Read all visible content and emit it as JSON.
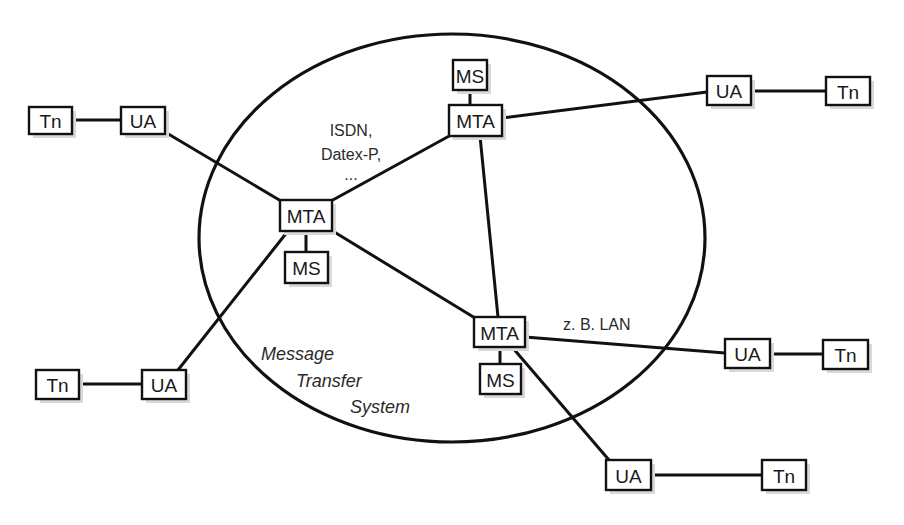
{
  "diagram": {
    "title": "Message Transfer System",
    "colors": {
      "stroke": "#111111",
      "text": "#1a1a1a",
      "background": "#ffffff",
      "shadow": "#d9d9d9"
    },
    "ellipse": {
      "cx": 452,
      "cy": 238,
      "rx": 253,
      "ry": 204
    },
    "nodes": [
      {
        "id": "tn-top-left",
        "label": "Tn",
        "x": 29,
        "y": 107,
        "w": 43,
        "h": 27
      },
      {
        "id": "ua-top-left",
        "label": "UA",
        "x": 121,
        "y": 107,
        "w": 44,
        "h": 27
      },
      {
        "id": "ms-top",
        "label": "MS",
        "x": 453,
        "y": 60,
        "w": 34,
        "h": 30
      },
      {
        "id": "mta-top",
        "label": "MTA",
        "x": 449,
        "y": 105,
        "w": 53,
        "h": 31
      },
      {
        "id": "ua-top-right",
        "label": "UA",
        "x": 707,
        "y": 76,
        "w": 44,
        "h": 29
      },
      {
        "id": "tn-top-right",
        "label": "Tn",
        "x": 826,
        "y": 77,
        "w": 44,
        "h": 28
      },
      {
        "id": "mta-left",
        "label": "MTA",
        "x": 280,
        "y": 200,
        "w": 52,
        "h": 31
      },
      {
        "id": "ms-left",
        "label": "MS",
        "x": 285,
        "y": 252,
        "w": 43,
        "h": 31
      },
      {
        "id": "mta-bottom",
        "label": "MTA",
        "x": 474,
        "y": 317,
        "w": 51,
        "h": 30
      },
      {
        "id": "ms-bottom",
        "label": "MS",
        "x": 480,
        "y": 364,
        "w": 41,
        "h": 30
      },
      {
        "id": "ua-mid-right",
        "label": "UA",
        "x": 725,
        "y": 339,
        "w": 45,
        "h": 29
      },
      {
        "id": "tn-mid-right",
        "label": "Tn",
        "x": 823,
        "y": 340,
        "w": 45,
        "h": 29
      },
      {
        "id": "tn-bottom-left",
        "label": "Tn",
        "x": 36,
        "y": 370,
        "w": 43,
        "h": 29
      },
      {
        "id": "ua-bottom-left",
        "label": "UA",
        "x": 142,
        "y": 370,
        "w": 44,
        "h": 29
      },
      {
        "id": "ua-bottom",
        "label": "UA",
        "x": 606,
        "y": 460,
        "w": 45,
        "h": 30
      },
      {
        "id": "tn-bottom",
        "label": "Tn",
        "x": 762,
        "y": 460,
        "w": 44,
        "h": 30
      }
    ],
    "edges": [
      {
        "from": "tn-top-left",
        "to": "ua-top-left",
        "x1": 72,
        "y1": 120,
        "x2": 121,
        "y2": 120
      },
      {
        "from": "ua-top-left",
        "to": "mta-left",
        "x1": 165,
        "y1": 132,
        "x2": 281,
        "y2": 201
      },
      {
        "from": "ms-top",
        "to": "mta-top",
        "x1": 470,
        "y1": 90,
        "x2": 470,
        "y2": 105
      },
      {
        "from": "mta-top",
        "to": "mta-left",
        "x1": 451,
        "y1": 135,
        "x2": 331,
        "y2": 201
      },
      {
        "from": "mta-top",
        "to": "mta-bottom",
        "x1": 480,
        "y1": 136,
        "x2": 498,
        "y2": 317
      },
      {
        "from": "mta-top",
        "to": "ua-top-right",
        "x1": 502,
        "y1": 118,
        "x2": 707,
        "y2": 92
      },
      {
        "from": "ua-top-right",
        "to": "tn-top-right",
        "x1": 751,
        "y1": 91,
        "x2": 826,
        "y2": 91
      },
      {
        "from": "mta-left",
        "to": "ms-left",
        "x1": 306,
        "y1": 231,
        "x2": 306,
        "y2": 252
      },
      {
        "from": "mta-left",
        "to": "mta-bottom",
        "x1": 331,
        "y1": 230,
        "x2": 475,
        "y2": 318
      },
      {
        "from": "mta-left",
        "to": "ua-bottom-left",
        "x1": 288,
        "y1": 231,
        "x2": 178,
        "y2": 370
      },
      {
        "from": "tn-bottom-left",
        "to": "ua-bottom-left",
        "x1": 79,
        "y1": 384,
        "x2": 142,
        "y2": 384
      },
      {
        "from": "mta-bottom",
        "to": "ms-bottom",
        "x1": 500,
        "y1": 347,
        "x2": 500,
        "y2": 364
      },
      {
        "from": "mta-bottom",
        "to": "ua-mid-right",
        "x1": 525,
        "y1": 337,
        "x2": 725,
        "y2": 353
      },
      {
        "from": "ua-mid-right",
        "to": "tn-mid-right",
        "x1": 770,
        "y1": 354,
        "x2": 823,
        "y2": 354
      },
      {
        "from": "mta-bottom",
        "to": "ua-bottom",
        "x1": 512,
        "y1": 347,
        "x2": 609,
        "y2": 460
      },
      {
        "from": "ua-bottom",
        "to": "tn-bottom",
        "x1": 651,
        "y1": 475,
        "x2": 762,
        "y2": 475
      }
    ],
    "labels": {
      "network_top": [
        "ISDN,",
        "Datex-P,",
        "..."
      ],
      "network_bottom": "z. B. LAN",
      "system_name": [
        "Message",
        "Transfer",
        "System"
      ]
    }
  }
}
